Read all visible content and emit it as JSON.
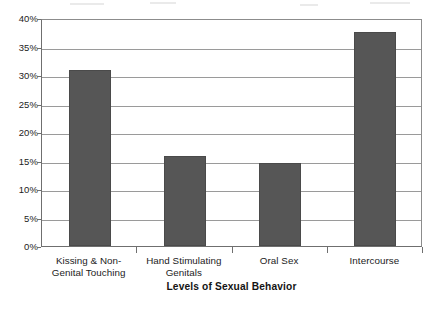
{
  "chart_data": {
    "type": "bar",
    "title": "",
    "subtitle": "",
    "xlabel": "Levels of Sexual Behavior",
    "ylabel": "",
    "categories": [
      "Kissing & Non-Genital Touching",
      "Hand Stimulating Genitals",
      "Oral Sex",
      "Intercourse"
    ],
    "category_lines": [
      [
        "Kissing & Non-",
        "Genital Touching"
      ],
      [
        "Hand Stimulating",
        "Genitals"
      ],
      [
        "Oral Sex"
      ],
      [
        "Intercourse"
      ]
    ],
    "values": [
      30.8,
      15.8,
      14.6,
      37.5
    ],
    "value_unit": "%",
    "ylim": [
      0,
      40
    ],
    "ytick_values": [
      0,
      5,
      10,
      15,
      20,
      25,
      30,
      35,
      40
    ],
    "ytick_labels": [
      "0%",
      "5%",
      "10%",
      "15%",
      "20%",
      "25%",
      "30%",
      "35%",
      "40%"
    ],
    "grid": "horizontal",
    "legend": "none",
    "bar_color": "#565656",
    "gridline_color": "#9a9a9a",
    "axis_color": "#6f6f6f",
    "background_color": "#ffffff"
  }
}
